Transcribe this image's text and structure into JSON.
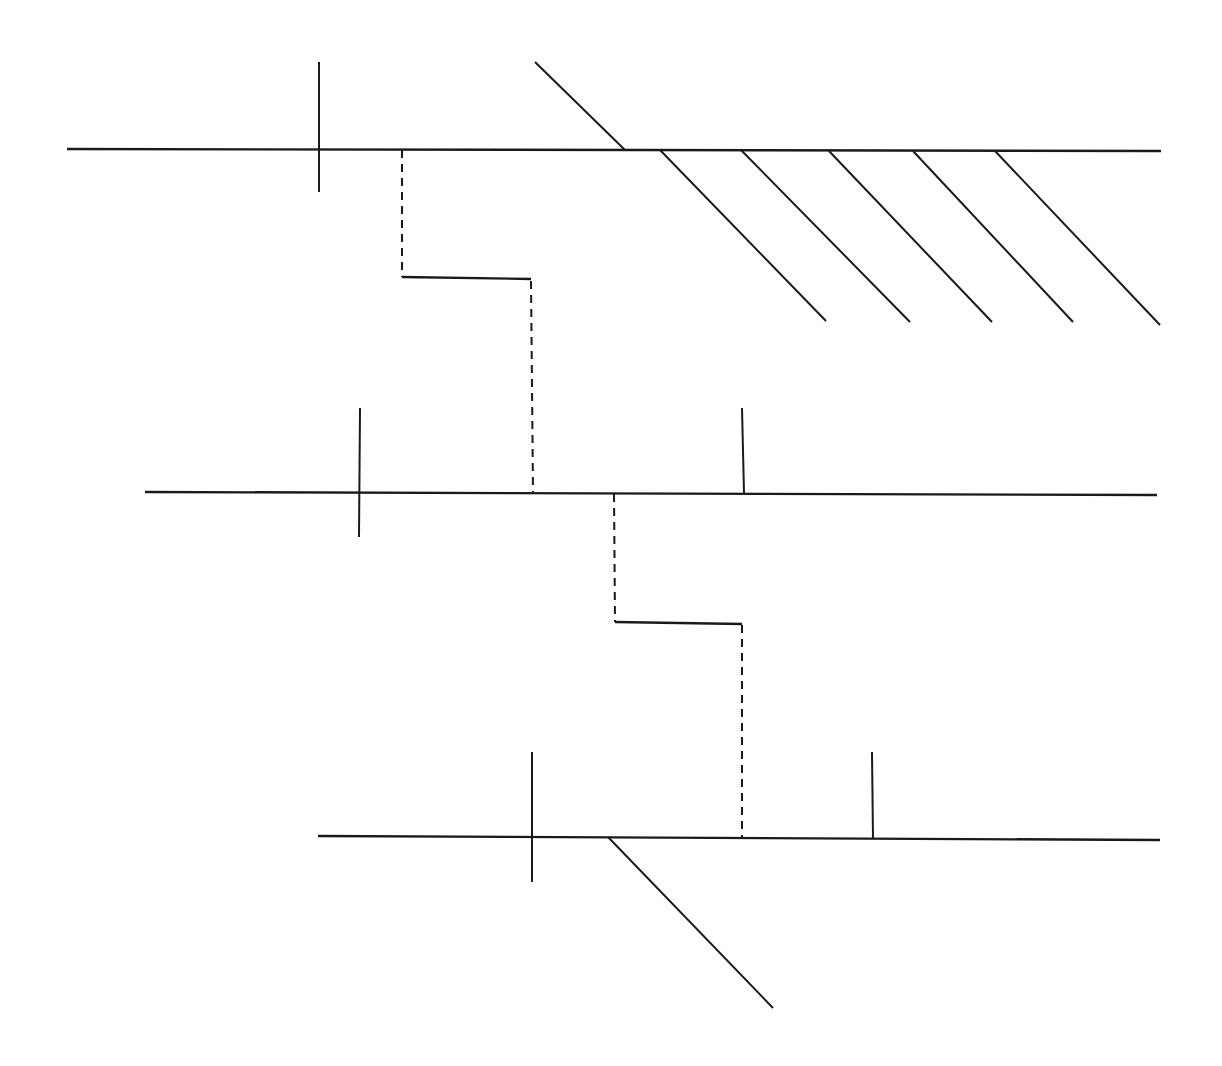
{
  "diagram": {
    "type": "offset-horizon-step-diagram",
    "stroke_color": "#1a1a1a",
    "background_color": "#ffffff",
    "stroke_width_main": 2.4,
    "stroke_width_minor": 2,
    "dash_pattern": "8 6",
    "horizons": [
      {
        "id": "upper",
        "x1": 67,
        "y1": 149,
        "x2": 1161,
        "y2": 151
      },
      {
        "id": "middle",
        "x1": 145,
        "y1": 492,
        "x2": 1157,
        "y2": 495
      },
      {
        "id": "lower",
        "x1": 318,
        "y1": 836,
        "x2": 1160,
        "y2": 840
      }
    ],
    "ticks": [
      {
        "id": "upper-tick",
        "x1": 319,
        "y1": 62,
        "x2": 319,
        "y2": 192
      },
      {
        "id": "middle-tick-left",
        "x1": 360,
        "y1": 408,
        "x2": 359,
        "y2": 537
      },
      {
        "id": "middle-tick-right",
        "x1": 742,
        "y1": 408,
        "x2": 744,
        "y2": 493
      },
      {
        "id": "lower-tick-left",
        "x1": 532,
        "y1": 752,
        "x2": 532,
        "y2": 882
      },
      {
        "id": "lower-tick-right",
        "x1": 872,
        "y1": 752,
        "x2": 873,
        "y2": 838
      }
    ],
    "diagonals": [
      {
        "id": "upper-fault",
        "x1": 535,
        "y1": 62,
        "x2": 625,
        "y2": 150
      },
      {
        "id": "hatch-1",
        "x1": 660,
        "y1": 150,
        "x2": 826,
        "y2": 321
      },
      {
        "id": "hatch-2",
        "x1": 741,
        "y1": 150,
        "x2": 910,
        "y2": 322
      },
      {
        "id": "hatch-3",
        "x1": 829,
        "y1": 151,
        "x2": 992,
        "y2": 322
      },
      {
        "id": "hatch-4",
        "x1": 913,
        "y1": 151,
        "x2": 1073,
        "y2": 322
      },
      {
        "id": "hatch-5",
        "x1": 995,
        "y1": 151,
        "x2": 1160,
        "y2": 325
      },
      {
        "id": "lower-fault",
        "x1": 608,
        "y1": 837,
        "x2": 773,
        "y2": 1008
      }
    ],
    "steps": [
      {
        "id": "upper-step",
        "dashed_segments": [
          {
            "x1": 402,
            "y1": 150,
            "x2": 402,
            "y2": 277
          },
          {
            "x1": 531,
            "y1": 281,
            "x2": 533,
            "y2": 492
          }
        ],
        "solid_segments": [
          {
            "x1": 402,
            "y1": 277,
            "x2": 531,
            "y2": 279
          }
        ]
      },
      {
        "id": "lower-step",
        "dashed_segments": [
          {
            "x1": 614,
            "y1": 494,
            "x2": 615,
            "y2": 622
          },
          {
            "x1": 742,
            "y1": 625,
            "x2": 742,
            "y2": 837
          }
        ],
        "solid_segments": [
          {
            "x1": 615,
            "y1": 622,
            "x2": 742,
            "y2": 624
          }
        ]
      }
    ]
  }
}
